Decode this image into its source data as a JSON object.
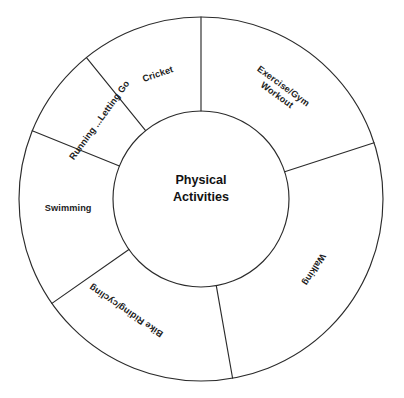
{
  "diagram": {
    "kind": "donut-wheel",
    "center_label": {
      "line1": "Physical",
      "line2": "Activities"
    },
    "geometry": {
      "center_x": 201,
      "center_y": 199,
      "outer_radius": 182,
      "inner_radius": 88,
      "stroke_color": "#2b2b2b",
      "fill_color": "#ffffff"
    },
    "segments": [
      {
        "id": "exercise-gym-workout",
        "label_line1": "Exercise/Gym",
        "label_line2": "Workout",
        "start_angle": 0,
        "end_angle": 72,
        "label_angle": 36,
        "label_radius": 134,
        "label_rotation": 36
      },
      {
        "id": "walking",
        "label_line1": "Walking",
        "label_line2": "",
        "start_angle": 72,
        "end_angle": 170,
        "label_angle": 122,
        "label_radius": 133,
        "label_rotation": 122
      },
      {
        "id": "bike-riding-cycling",
        "label_line1": "Bike Riding/cycling",
        "label_line2": "",
        "start_angle": 170,
        "end_angle": 235,
        "label_angle": 214,
        "label_radius": 134,
        "label_rotation": 214
      },
      {
        "id": "swimming",
        "label_line1": "Swimming",
        "label_line2": "",
        "start_angle": 235,
        "end_angle": 292,
        "label_angle": 266,
        "label_radius": 133,
        "label_rotation": 0
      },
      {
        "id": "running-letting-go",
        "label_line1": "Running ...Letting Go",
        "label_line2": "",
        "start_angle": 292,
        "end_angle": 321,
        "label_angle": 308,
        "label_radius": 128,
        "label_rotation": 306
      },
      {
        "id": "cricket",
        "label_line1": "Cricket",
        "label_line2": "",
        "start_angle": 321,
        "end_angle": 360,
        "label_angle": 341,
        "label_radius": 132,
        "label_rotation": 341
      }
    ]
  }
}
